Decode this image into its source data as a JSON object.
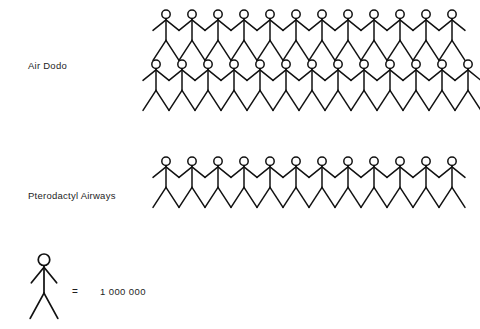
{
  "rows": [
    {
      "label": "Air Dodo",
      "figures": 25,
      "value": 25000000
    },
    {
      "label": "Pterodactyl Airways",
      "figures": 12,
      "value": 12000000
    }
  ],
  "legend": {
    "equals_sign": "=",
    "unit_value": "1 000 000",
    "figure_icon": "person-icon"
  },
  "chart_data": {
    "type": "bar",
    "subtype": "pictogram",
    "title": "",
    "xlabel": "",
    "ylabel": "",
    "categories": [
      "Air Dodo",
      "Pterodactyl Airways"
    ],
    "values": [
      25000000,
      12000000
    ],
    "icon_counts": [
      25,
      12
    ],
    "icon_unit_value": 1000000,
    "icon_unit_label": "1 000 000",
    "icon_symbol": "person-icon",
    "row_wrapping": {
      "Air Dodo": [
        12,
        13
      ],
      "Pterodactyl Airways": [
        12
      ]
    },
    "grid": false,
    "legend": "1 person icon = 1 000 000",
    "legend_position": "bottom-left",
    "colors": {
      "ink": "#111111",
      "background": "#ffffff"
    }
  }
}
